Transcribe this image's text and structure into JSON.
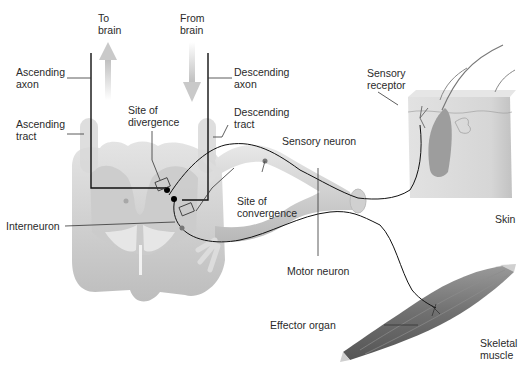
{
  "diagram": {
    "labels": {
      "to_brain": [
        "To",
        "brain"
      ],
      "from_brain": [
        "From",
        "brain"
      ],
      "ascending_axon": [
        "Ascending",
        "axon"
      ],
      "descending_axon": [
        "Descending",
        "axon"
      ],
      "ascending_tract": [
        "Ascending",
        "tract"
      ],
      "descending_tract": [
        "Descending",
        "tract"
      ],
      "site_of_divergence": [
        "Site of",
        "divergence"
      ],
      "site_of_convergence": [
        "Site of",
        "convergence"
      ],
      "sensory_neuron": "Sensory neuron",
      "sensory_receptor": [
        "Sensory",
        "receptor"
      ],
      "interneuron": "Interneuron",
      "motor_neuron": "Motor neuron",
      "skin": "Skin",
      "effector_organ": "Effector organ",
      "skeletal_muscle": [
        "Skeletal",
        "muscle"
      ]
    },
    "colors": {
      "background": "#ffffff",
      "spinal_cord": "#d9d9d9",
      "gray_matter": "#c4c4c4",
      "nerve": "#cfcfcf",
      "axon_line": "#111111",
      "leader_line": "#333333",
      "arrow": "#cccccc",
      "skin": "#dcdcdc",
      "muscle": "#777777",
      "text": "#2a2a2a"
    }
  }
}
